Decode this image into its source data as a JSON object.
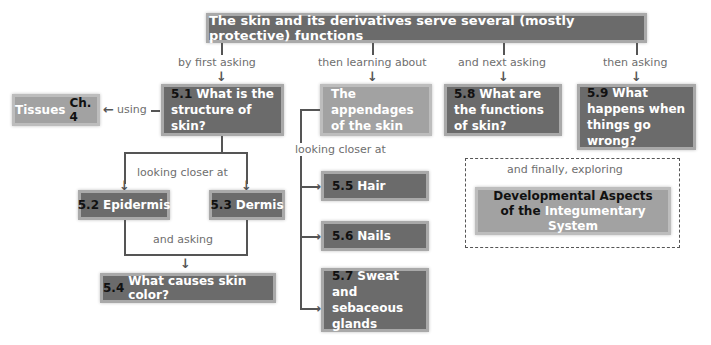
{
  "title": "The skin and its derivatives serve several (mostly protective) functions",
  "connectors": {
    "first": "by first asking",
    "then_learning": "then learning about",
    "next": "and next asking",
    "then_asking": "then asking",
    "using": "using",
    "closer_left": "looking closer at",
    "and_asking": "and asking",
    "closer_mid": "looking closer at",
    "finally": "and finally, exploring"
  },
  "nodes": {
    "tissues": {
      "label": "Tissues",
      "ref": "Ch. 4"
    },
    "n51": {
      "num": "5.1",
      "label": "What is the structure of skin?"
    },
    "appendages": {
      "label": "The appendages of the skin"
    },
    "n58": {
      "num": "5.8",
      "label": "What are the functions of skin?"
    },
    "n59": {
      "num": "5.9",
      "label": "What happens when things go wrong?"
    },
    "n52": {
      "num": "5.2",
      "label": "Epidermis"
    },
    "n53": {
      "num": "5.3",
      "label": "Dermis"
    },
    "n54": {
      "num": "5.4",
      "label": "What causes skin color?"
    },
    "n55": {
      "num": "5.5",
      "label": "Hair"
    },
    "n56": {
      "num": "5.6",
      "label": "Nails"
    },
    "n57": {
      "num": "5.7",
      "label": "Sweat and sebaceous glands"
    },
    "dev": {
      "part1": "Developmental Aspects",
      "part2": "of the",
      "part3": "Integumentary System"
    }
  }
}
